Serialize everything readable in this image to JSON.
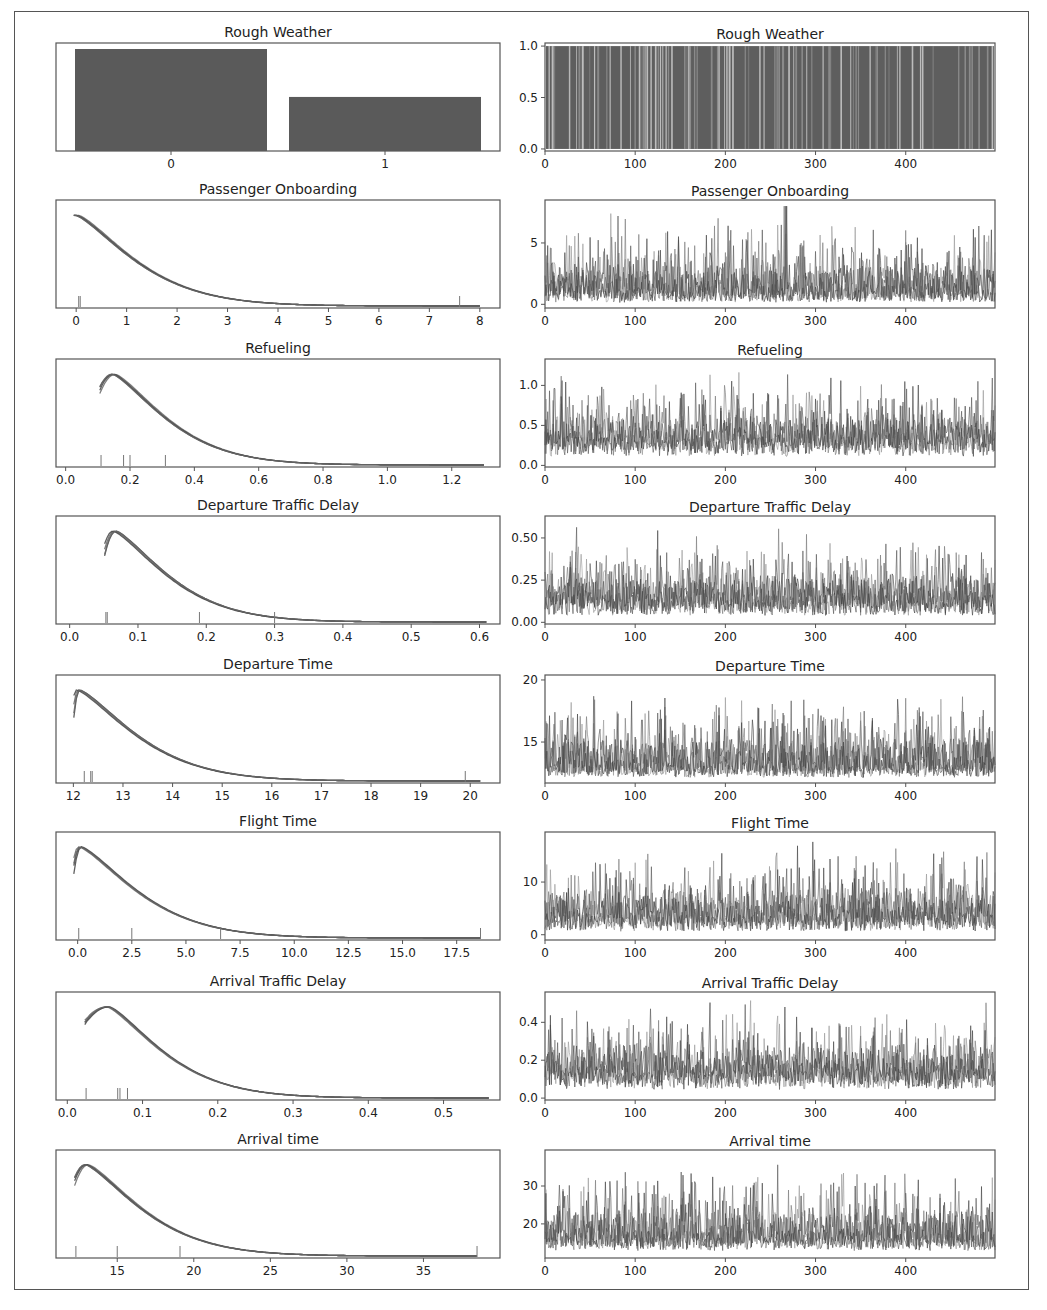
{
  "figure": {
    "type": "traceplot",
    "rows": 8,
    "columns": [
      "posterior-density",
      "trace"
    ],
    "line_color": "#555555",
    "frame_color": "#555555"
  },
  "chart_data": [
    {
      "name": "Rough Weather",
      "left": {
        "type": "bar",
        "title": "Rough Weather",
        "categories": [
          "0",
          "1"
        ],
        "values": [
          1.0,
          0.53
        ],
        "xticks": [
          "0",
          "1"
        ]
      },
      "right": {
        "type": "line",
        "title": "Rough Weather",
        "x_range": [
          0,
          499
        ],
        "xticks": [
          0,
          100,
          200,
          300,
          400
        ],
        "ylim": [
          -0.02,
          1.03
        ],
        "yticks": [
          "0.0",
          "0.5",
          "1.0"
        ],
        "description": "binary samples (0/1) per draw, dense vertical lines"
      }
    },
    {
      "name": "Passenger Onboarding",
      "left": {
        "type": "line",
        "title": "Passenger Onboarding",
        "xlim": [
          -0.4,
          8.4
        ],
        "xticks": [
          "0",
          "1",
          "2",
          "3",
          "4",
          "5",
          "6",
          "7",
          "8"
        ],
        "kde_peak_x": 0.0,
        "kde_tail_end": 8.0,
        "rug": [
          0.05,
          0.08,
          7.6
        ]
      },
      "right": {
        "type": "line",
        "title": "Passenger Onboarding",
        "xticks": [
          0,
          100,
          200,
          300,
          400
        ],
        "ylim": [
          -0.3,
          8.5
        ],
        "yticks": [
          "0",
          "5"
        ],
        "baseline": 0.5,
        "max": 8.0
      }
    },
    {
      "name": "Refueling",
      "left": {
        "type": "line",
        "title": "Refueling",
        "xlim": [
          -0.03,
          1.35
        ],
        "xticks": [
          "0.0",
          "0.2",
          "0.4",
          "0.6",
          "0.8",
          "1.0",
          "1.2"
        ],
        "kde_peak_x": 0.15,
        "kde_tail_end": 1.3,
        "rug": [
          0.11,
          0.18,
          0.2,
          0.31
        ]
      },
      "right": {
        "type": "line",
        "title": "Refueling",
        "xticks": [
          0,
          100,
          200,
          300,
          400
        ],
        "ylim": [
          -0.02,
          1.33
        ],
        "yticks": [
          "0.0",
          "0.5",
          "1.0"
        ],
        "baseline": 0.22,
        "max": 1.27
      }
    },
    {
      "name": "Departure Traffic Delay",
      "left": {
        "type": "line",
        "title": "Departure Traffic Delay",
        "xlim": [
          -0.02,
          0.63
        ],
        "xticks": [
          "0.0",
          "0.1",
          "0.2",
          "0.3",
          "0.4",
          "0.5",
          "0.6"
        ],
        "kde_peak_x": 0.065,
        "kde_tail_end": 0.61,
        "rug": [
          0.053,
          0.055,
          0.19,
          0.3
        ]
      },
      "right": {
        "type": "line",
        "title": "Departure Traffic Delay",
        "xticks": [
          0,
          100,
          200,
          300,
          400
        ],
        "ylim": [
          -0.01,
          0.63
        ],
        "yticks": [
          "0.00",
          "0.25",
          "0.50"
        ],
        "baseline": 0.08,
        "max": 0.61
      }
    },
    {
      "name": "Departure Time",
      "left": {
        "type": "line",
        "title": "Departure Time",
        "xlim": [
          11.65,
          20.6
        ],
        "xticks": [
          "12",
          "13",
          "14",
          "15",
          "16",
          "17",
          "18",
          "19",
          "20"
        ],
        "kde_peak_x": 12.1,
        "kde_tail_end": 20.2,
        "rug": [
          12.22,
          12.35,
          12.38,
          19.9
        ]
      },
      "right": {
        "type": "line",
        "title": "Departure Time",
        "xticks": [
          0,
          100,
          200,
          300,
          400
        ],
        "ylim": [
          11.7,
          20.4
        ],
        "yticks": [
          "15",
          "20"
        ],
        "baseline": 12.5,
        "max": 20.0
      }
    },
    {
      "name": "Flight Time",
      "left": {
        "type": "line",
        "title": "Flight Time",
        "xlim": [
          -1.0,
          19.5
        ],
        "xticks": [
          "0.0",
          "2.5",
          "5.0",
          "7.5",
          "10.0",
          "12.5",
          "15.0",
          "17.5"
        ],
        "kde_peak_x": 0.1,
        "kde_tail_end": 18.6,
        "rug": [
          0.05,
          2.5,
          6.6,
          18.6
        ]
      },
      "right": {
        "type": "line",
        "title": "Flight Time",
        "xticks": [
          0,
          100,
          200,
          300,
          400
        ],
        "ylim": [
          -1.0,
          19.5
        ],
        "yticks": [
          "0",
          "10"
        ],
        "baseline": 2.0,
        "max": 18.5
      }
    },
    {
      "name": "Arrival Traffic Delay",
      "left": {
        "type": "line",
        "title": "Arrival Traffic Delay",
        "xlim": [
          -0.015,
          0.575
        ],
        "xticks": [
          "0.0",
          "0.1",
          "0.2",
          "0.3",
          "0.4",
          "0.5"
        ],
        "kde_peak_x": 0.055,
        "kde_tail_end": 0.56,
        "rug": [
          0.025,
          0.067,
          0.07,
          0.08
        ]
      },
      "right": {
        "type": "line",
        "title": "Arrival Traffic Delay",
        "xticks": [
          0,
          100,
          200,
          300,
          400
        ],
        "ylim": [
          -0.01,
          0.56
        ],
        "yticks": [
          "0.0",
          "0.2",
          "0.4"
        ],
        "baseline": 0.09,
        "max": 0.55
      }
    },
    {
      "name": "Arrival time",
      "left": {
        "type": "line",
        "title": "Arrival time",
        "xlim": [
          11.0,
          40.0
        ],
        "xticks": [
          "15",
          "20",
          "25",
          "30",
          "35"
        ],
        "kde_peak_x": 13.0,
        "kde_tail_end": 38.5,
        "rug": [
          12.3,
          15.0,
          19.1,
          38.5
        ]
      },
      "right": {
        "type": "line",
        "title": "Arrival time",
        "xticks": [
          0,
          100,
          200,
          300,
          400
        ],
        "ylim": [
          11.0,
          39.5
        ],
        "yticks": [
          "20",
          "30"
        ],
        "baseline": 14.5,
        "max": 38.0
      }
    }
  ]
}
